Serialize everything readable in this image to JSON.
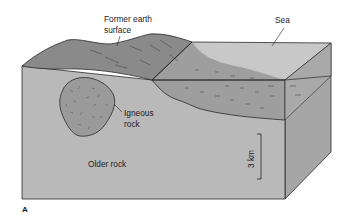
{
  "figure_label": "A",
  "labels": {
    "former_surface_line1": "Former earth",
    "former_surface_line2": "surface",
    "sea": "Sea",
    "igneous_line1": "Igneous",
    "igneous_line2": "rock",
    "older_rock": "Older rock",
    "scale": "3 km"
  },
  "colors": {
    "front_face": "#b9b9b9",
    "side_face": "#a6a6a6",
    "land_top": "#8a8a8a",
    "sea_top": "#c8c8c8",
    "sediment": "#9e9e9e",
    "water_front": "#a9a9a9",
    "igneous": "#9a9a9a",
    "outline": "#2a2a2a"
  }
}
